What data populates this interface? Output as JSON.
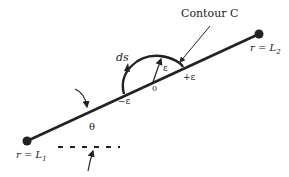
{
  "diagram": {
    "contour_label": "Contour C",
    "ds_label": "ds",
    "epsilon_radius_label": "ε",
    "minus_epsilon_label": "−ε",
    "plus_epsilon_label": "+ε",
    "origin_label": "0",
    "theta_label": "θ",
    "left_endpoint_label": "r = L",
    "left_endpoint_sub": "1",
    "right_endpoint_label": "r = L",
    "right_endpoint_sub": "2",
    "colors": {
      "stroke": "#222222",
      "background": "#ffffff"
    }
  }
}
